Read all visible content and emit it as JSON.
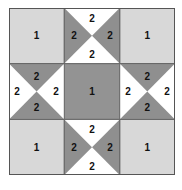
{
  "diagram": {
    "grid": {
      "rows": 3,
      "cols": 3
    },
    "colors": {
      "light": "#d8d8d8",
      "center": "#939393",
      "triangle_gray": "#8f8f8f",
      "white": "#ffffff",
      "line": "#555555"
    },
    "labels": {
      "corner_tl": "1",
      "corner_tr": "1",
      "corner_bl": "1",
      "corner_br": "1",
      "center": "1",
      "top": {
        "top": "2",
        "left": "2",
        "right": "2",
        "bottom": "2"
      },
      "bottom": {
        "top": "2",
        "left": "2",
        "right": "2",
        "bottom": "2"
      },
      "left": {
        "top": "2",
        "left": "2",
        "right": "2",
        "bottom": "2"
      },
      "right": {
        "top": "2",
        "left": "2",
        "right": "2",
        "bottom": "2"
      }
    }
  }
}
